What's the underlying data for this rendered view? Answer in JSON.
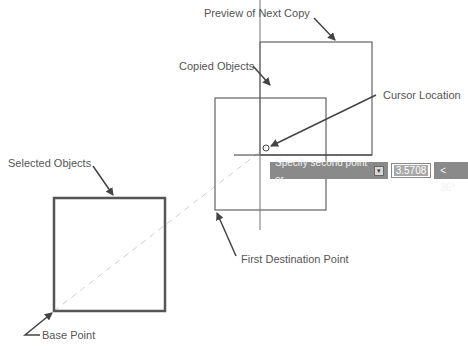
{
  "labels": {
    "preview": "Preview of Next Copy",
    "copied": "Copied Objects",
    "cursor": "Cursor Location",
    "selected": "Selected Objects",
    "first_dest": "First Destination Point",
    "base": "Base Point"
  },
  "dynamic_input": {
    "prompt": "Specify second point or",
    "icon": "down-arrow-icon",
    "distance_value": "3.5708",
    "angle_value": "< 36°"
  },
  "colors": {
    "line": "#444444",
    "selected_line": "#555555",
    "dashed": "#cccccc",
    "tooltip_bg": "#8a8a8a"
  }
}
